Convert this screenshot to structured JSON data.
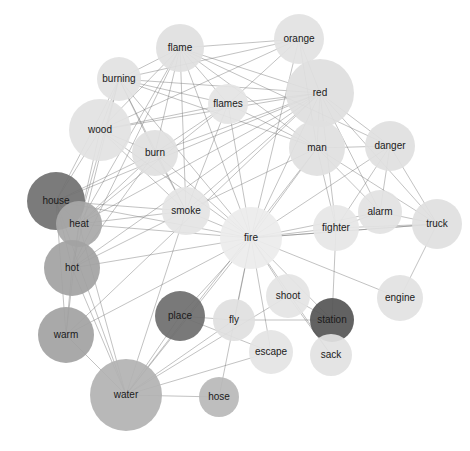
{
  "figure": {
    "type": "network-graph",
    "title": "",
    "caption": "",
    "background_color": "#ffffff",
    "edge_color": "#6f6f6f",
    "label_color": "#1a1a1a",
    "width": 470,
    "height": 451
  },
  "chart_data": {
    "type": "scatter",
    "title": "",
    "xlabel": "",
    "ylabel": "",
    "layout": "force-directed-network",
    "grid": false,
    "legend": "none",
    "nodes": [
      {
        "id": "flame",
        "label": "flame",
        "x": 180,
        "y": 48,
        "r": 24,
        "color": "#e0e0e0"
      },
      {
        "id": "orange",
        "label": "orange",
        "x": 299,
        "y": 39,
        "r": 25,
        "color": "#e2e2e2"
      },
      {
        "id": "burning",
        "label": "burning",
        "x": 119,
        "y": 79,
        "r": 22,
        "color": "#e2e2e2"
      },
      {
        "id": "red",
        "label": "red",
        "x": 320,
        "y": 93,
        "r": 34,
        "color": "#dedede"
      },
      {
        "id": "flames",
        "label": "flames",
        "x": 228,
        "y": 104,
        "r": 20,
        "color": "#e4e4e4"
      },
      {
        "id": "wood",
        "label": "wood",
        "x": 100,
        "y": 130,
        "r": 31,
        "color": "#e2e2e2"
      },
      {
        "id": "burn",
        "label": "burn",
        "x": 155,
        "y": 153,
        "r": 23,
        "color": "#e0e0e0"
      },
      {
        "id": "man",
        "label": "man",
        "x": 317,
        "y": 148,
        "r": 28,
        "color": "#e0e0e0"
      },
      {
        "id": "danger",
        "label": "danger",
        "x": 390,
        "y": 146,
        "r": 25,
        "color": "#e0e0e0"
      },
      {
        "id": "house",
        "label": "house",
        "x": 56,
        "y": 201,
        "r": 29,
        "color": "#707070"
      },
      {
        "id": "heat",
        "label": "heat",
        "x": 79,
        "y": 224,
        "r": 23,
        "color": "#a8a8a8"
      },
      {
        "id": "smoke",
        "label": "smoke",
        "x": 186,
        "y": 211,
        "r": 24,
        "color": "#e4e4e4"
      },
      {
        "id": "fighter",
        "label": "fighter",
        "x": 336,
        "y": 228,
        "r": 23,
        "color": "#e6e6e6"
      },
      {
        "id": "alarm",
        "label": "alarm",
        "x": 380,
        "y": 212,
        "r": 22,
        "color": "#e2e2e2"
      },
      {
        "id": "truck",
        "label": "truck",
        "x": 437,
        "y": 224,
        "r": 25,
        "color": "#e0e0e0"
      },
      {
        "id": "fire",
        "label": "fire",
        "x": 251,
        "y": 238,
        "r": 31,
        "color": "#ececec"
      },
      {
        "id": "hot",
        "label": "hot",
        "x": 72,
        "y": 268,
        "r": 28,
        "color": "#a2a2a2"
      },
      {
        "id": "shoot",
        "label": "shoot",
        "x": 288,
        "y": 296,
        "r": 22,
        "color": "#e4e4e4"
      },
      {
        "id": "engine",
        "label": "engine",
        "x": 400,
        "y": 298,
        "r": 23,
        "color": "#e2e2e2"
      },
      {
        "id": "place",
        "label": "place",
        "x": 180,
        "y": 316,
        "r": 25,
        "color": "#6e6e6e"
      },
      {
        "id": "fly",
        "label": "fly",
        "x": 234,
        "y": 320,
        "r": 21,
        "color": "#e0e0e0"
      },
      {
        "id": "station",
        "label": "station",
        "x": 332,
        "y": 320,
        "r": 22,
        "color": "#555555"
      },
      {
        "id": "warm",
        "label": "warm",
        "x": 66,
        "y": 335,
        "r": 28,
        "color": "#a2a2a2"
      },
      {
        "id": "escape",
        "label": "escape",
        "x": 271,
        "y": 352,
        "r": 22,
        "color": "#e4e4e4"
      },
      {
        "id": "sack",
        "label": "sack",
        "x": 331,
        "y": 355,
        "r": 21,
        "color": "#e2e2e2"
      },
      {
        "id": "water",
        "label": "water",
        "x": 126,
        "y": 395,
        "r": 36,
        "color": "#b2b2b2"
      },
      {
        "id": "hose",
        "label": "hose",
        "x": 219,
        "y": 397,
        "r": 20,
        "color": "#b8b8b8"
      }
    ],
    "edges": [
      [
        "flame",
        "orange"
      ],
      [
        "flame",
        "burning"
      ],
      [
        "flame",
        "red"
      ],
      [
        "flame",
        "flames"
      ],
      [
        "flame",
        "wood"
      ],
      [
        "flame",
        "burn"
      ],
      [
        "flame",
        "fire"
      ],
      [
        "flame",
        "smoke"
      ],
      [
        "flame",
        "heat"
      ],
      [
        "flame",
        "man"
      ],
      [
        "flame",
        "hot"
      ],
      [
        "flame",
        "danger"
      ],
      [
        "orange",
        "red"
      ],
      [
        "orange",
        "burning"
      ],
      [
        "orange",
        "fire"
      ],
      [
        "orange",
        "flames"
      ],
      [
        "orange",
        "man"
      ],
      [
        "orange",
        "wood"
      ],
      [
        "burning",
        "red"
      ],
      [
        "burning",
        "flames"
      ],
      [
        "burning",
        "wood"
      ],
      [
        "burning",
        "burn"
      ],
      [
        "burning",
        "fire"
      ],
      [
        "burning",
        "smoke"
      ],
      [
        "burning",
        "heat"
      ],
      [
        "burning",
        "house"
      ],
      [
        "burning",
        "hot"
      ],
      [
        "burning",
        "man"
      ],
      [
        "red",
        "flames"
      ],
      [
        "red",
        "man"
      ],
      [
        "red",
        "danger"
      ],
      [
        "red",
        "fire"
      ],
      [
        "red",
        "burn"
      ],
      [
        "red",
        "wood"
      ],
      [
        "red",
        "smoke"
      ],
      [
        "red",
        "heat"
      ],
      [
        "red",
        "truck"
      ],
      [
        "red",
        "alarm"
      ],
      [
        "red",
        "hot"
      ],
      [
        "red",
        "warm"
      ],
      [
        "red",
        "fighter"
      ],
      [
        "red",
        "house"
      ],
      [
        "flames",
        "burn"
      ],
      [
        "flames",
        "fire"
      ],
      [
        "flames",
        "smoke"
      ],
      [
        "flames",
        "wood"
      ],
      [
        "flames",
        "heat"
      ],
      [
        "flames",
        "man"
      ],
      [
        "wood",
        "burn"
      ],
      [
        "wood",
        "fire"
      ],
      [
        "wood",
        "heat"
      ],
      [
        "wood",
        "smoke"
      ],
      [
        "wood",
        "house"
      ],
      [
        "burn",
        "fire"
      ],
      [
        "burn",
        "heat"
      ],
      [
        "burn",
        "smoke"
      ],
      [
        "burn",
        "hot"
      ],
      [
        "burn",
        "house"
      ],
      [
        "man",
        "fire"
      ],
      [
        "man",
        "danger"
      ],
      [
        "man",
        "fighter"
      ],
      [
        "man",
        "alarm"
      ],
      [
        "man",
        "truck"
      ],
      [
        "man",
        "smoke"
      ],
      [
        "man",
        "water"
      ],
      [
        "danger",
        "alarm"
      ],
      [
        "danger",
        "fire"
      ],
      [
        "danger",
        "truck"
      ],
      [
        "danger",
        "fighter"
      ],
      [
        "house",
        "heat"
      ],
      [
        "house",
        "fire"
      ],
      [
        "house",
        "hot"
      ],
      [
        "house",
        "smoke"
      ],
      [
        "house",
        "warm"
      ],
      [
        "house",
        "water"
      ],
      [
        "heat",
        "fire"
      ],
      [
        "heat",
        "hot"
      ],
      [
        "heat",
        "smoke"
      ],
      [
        "heat",
        "warm"
      ],
      [
        "heat",
        "water"
      ],
      [
        "smoke",
        "fire"
      ],
      [
        "smoke",
        "hot"
      ],
      [
        "smoke",
        "water"
      ],
      [
        "fighter",
        "fire"
      ],
      [
        "fighter",
        "alarm"
      ],
      [
        "fighter",
        "truck"
      ],
      [
        "fighter",
        "station"
      ],
      [
        "alarm",
        "fire"
      ],
      [
        "alarm",
        "truck"
      ],
      [
        "truck",
        "fire"
      ],
      [
        "truck",
        "engine"
      ],
      [
        "fire",
        "hot"
      ],
      [
        "fire",
        "shoot"
      ],
      [
        "fire",
        "engine"
      ],
      [
        "fire",
        "place"
      ],
      [
        "fire",
        "fly"
      ],
      [
        "fire",
        "station"
      ],
      [
        "fire",
        "warm"
      ],
      [
        "fire",
        "escape"
      ],
      [
        "fire",
        "sack"
      ],
      [
        "fire",
        "water"
      ],
      [
        "fire",
        "hose"
      ],
      [
        "fire",
        "truck"
      ],
      [
        "hot",
        "warm"
      ],
      [
        "hot",
        "water"
      ],
      [
        "shoot",
        "station"
      ],
      [
        "shoot",
        "sack"
      ],
      [
        "shoot",
        "water"
      ],
      [
        "place",
        "fly"
      ],
      [
        "place",
        "water"
      ],
      [
        "place",
        "escape"
      ],
      [
        "fly",
        "station"
      ],
      [
        "fly",
        "water"
      ],
      [
        "warm",
        "water"
      ],
      [
        "escape",
        "water"
      ],
      [
        "water",
        "hose"
      ]
    ]
  }
}
